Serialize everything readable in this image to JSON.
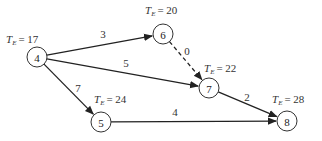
{
  "diagram": {
    "type": "activity-network",
    "nodes": [
      {
        "id": "4",
        "label": "4",
        "cx": 37,
        "cy": 57,
        "te_prefix": "T",
        "te_sub": "E",
        "te_value": "= 17",
        "te_x": 6,
        "te_y": 43
      },
      {
        "id": "6",
        "label": "6",
        "cx": 163,
        "cy": 34,
        "te_prefix": "T",
        "te_sub": "E",
        "te_value": "= 20",
        "te_x": 145,
        "te_y": 14
      },
      {
        "id": "7",
        "label": "7",
        "cx": 209,
        "cy": 88,
        "te_prefix": "T",
        "te_sub": "E",
        "te_value": "= 22",
        "te_x": 204,
        "te_y": 72
      },
      {
        "id": "5",
        "label": "5",
        "cx": 101,
        "cy": 122,
        "te_prefix": "T",
        "te_sub": "E",
        "te_value": "= 24",
        "te_x": 94,
        "te_y": 103
      },
      {
        "id": "8",
        "label": "8",
        "cx": 287,
        "cy": 121,
        "te_prefix": "T",
        "te_sub": "E",
        "te_value": "= 28",
        "te_x": 272,
        "te_y": 103
      }
    ],
    "edges": [
      {
        "from": "4",
        "to": "6",
        "weight": "3",
        "style": "solid",
        "wx": 103,
        "wy": 38
      },
      {
        "from": "4",
        "to": "7",
        "weight": "5",
        "style": "solid",
        "wx": 126,
        "wy": 67
      },
      {
        "from": "4",
        "to": "5",
        "weight": "7",
        "style": "solid",
        "wx": 78,
        "wy": 92
      },
      {
        "from": "6",
        "to": "7",
        "weight": "0",
        "style": "dashed",
        "wx": 187,
        "wy": 55
      },
      {
        "from": "7",
        "to": "8",
        "weight": "2",
        "style": "solid",
        "wx": 247,
        "wy": 101
      },
      {
        "from": "5",
        "to": "8",
        "weight": "4",
        "style": "solid",
        "wx": 175,
        "wy": 116
      }
    ]
  }
}
